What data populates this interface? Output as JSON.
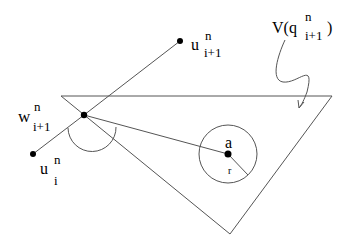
{
  "diagram": {
    "type": "geometric-figure",
    "labels": {
      "w": {
        "base": "w",
        "sup": "n",
        "sub": "i+1"
      },
      "u_next": {
        "base": "u",
        "sup": "n",
        "sub": "i+1"
      },
      "u_curr": {
        "base": "u",
        "sup": "n",
        "sub": "i"
      },
      "region": {
        "prefix": "V(q",
        "sup": "n",
        "sub": "i+1",
        "suffix": ")"
      },
      "center": "a",
      "radius": "r"
    },
    "points": {
      "w": [
        84,
        115
      ],
      "u_next": [
        180,
        41
      ],
      "u_curr": [
        33,
        154
      ],
      "a": [
        228,
        154
      ]
    },
    "triangle": [
      [
        61,
        96
      ],
      [
        332,
        96
      ],
      [
        230,
        234
      ]
    ],
    "circle": {
      "cx": 228,
      "cy": 154,
      "r": 29
    },
    "colors": {
      "stroke": "#555555",
      "dot": "#000000",
      "text": "#000000"
    }
  }
}
